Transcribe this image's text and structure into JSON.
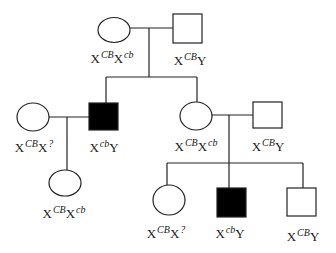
{
  "diagram": {
    "type": "pedigree",
    "colors": {
      "line": "#222222",
      "affected": "#000000",
      "unaffected": "#ffffff"
    },
    "individuals": [
      {
        "id": "gen1-mother",
        "sex": "female",
        "affected": false,
        "genotype": {
          "base1": "X",
          "sup1": "CB",
          "base2": "X",
          "sup2": "cb"
        }
      },
      {
        "id": "gen1-father",
        "sex": "male",
        "affected": false,
        "genotype": {
          "base1": "X",
          "sup1": "CB",
          "base2": "Y",
          "sup2": ""
        }
      },
      {
        "id": "gen2-wife",
        "sex": "female",
        "affected": false,
        "genotype": {
          "base1": "X",
          "sup1": "CB",
          "base2": "X",
          "sup2": "?"
        }
      },
      {
        "id": "gen2-son",
        "sex": "male",
        "affected": true,
        "genotype": {
          "base1": "X",
          "sup1": "cb",
          "base2": "Y",
          "sup2": ""
        }
      },
      {
        "id": "gen2-daughter",
        "sex": "female",
        "affected": false,
        "genotype": {
          "base1": "X",
          "sup1": "CB",
          "base2": "X",
          "sup2": "cb"
        }
      },
      {
        "id": "gen2-husband",
        "sex": "male",
        "affected": false,
        "genotype": {
          "base1": "X",
          "sup1": "CB",
          "base2": "Y",
          "sup2": ""
        }
      },
      {
        "id": "gen3-granddaughter-left",
        "sex": "female",
        "affected": false,
        "genotype": {
          "base1": "X",
          "sup1": "CB",
          "base2": "X",
          "sup2": "cb"
        }
      },
      {
        "id": "gen3-granddaughter-right",
        "sex": "female",
        "affected": false,
        "genotype": {
          "base1": "X",
          "sup1": "CB",
          "base2": "X",
          "sup2": "?"
        }
      },
      {
        "id": "gen3-grandson-affected",
        "sex": "male",
        "affected": true,
        "genotype": {
          "base1": "X",
          "sup1": "cb",
          "base2": "Y",
          "sup2": ""
        }
      },
      {
        "id": "gen3-grandson-unaffected",
        "sex": "male",
        "affected": false,
        "genotype": {
          "base1": "X",
          "sup1": "CB",
          "base2": "Y",
          "sup2": ""
        }
      }
    ]
  }
}
